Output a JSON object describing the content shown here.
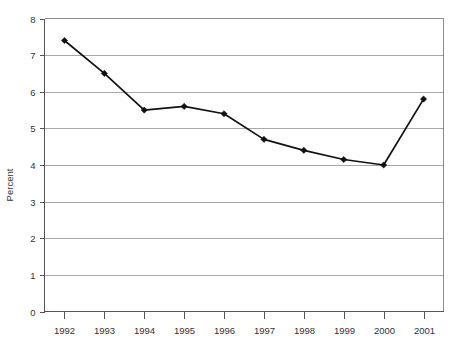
{
  "chart_data": {
    "type": "line",
    "title": "",
    "subtitle": "",
    "xlabel": "",
    "ylabel": "Percent",
    "categories": [
      "1992",
      "1993",
      "1994",
      "1995",
      "1996",
      "1997",
      "1998",
      "1999",
      "2000",
      "2001"
    ],
    "values": [
      7.4,
      6.5,
      5.5,
      5.6,
      5.4,
      4.7,
      4.4,
      4.15,
      4.0,
      5.8
    ],
    "series": [
      {
        "name": "Percent",
        "values": [
          7.4,
          6.5,
          5.5,
          5.6,
          5.4,
          4.7,
          4.4,
          4.15,
          4.0,
          5.8
        ]
      }
    ],
    "ylim": [
      0,
      8
    ],
    "y_ticks": [
      "0",
      "1",
      "2",
      "3",
      "4",
      "5",
      "6",
      "7",
      "8"
    ],
    "x_ticks": [
      "1992",
      "1993",
      "1994",
      "1995",
      "1996",
      "1997",
      "1998",
      "1999",
      "2000",
      "2001"
    ],
    "grid": "horizontal",
    "legend": "none",
    "marker": "diamond",
    "line_color": "#111111",
    "grid_color": "#a8a8a8",
    "background_color": "#ffffff",
    "annotations": []
  },
  "axes": {
    "y_title": "Percent"
  }
}
